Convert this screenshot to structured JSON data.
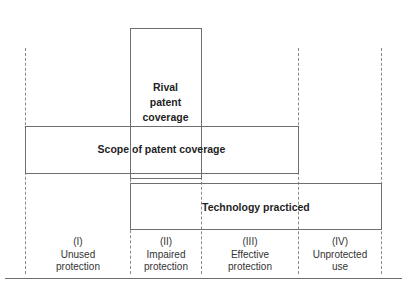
{
  "diagram": {
    "boxes": {
      "rival": {
        "label_line1": "Rival",
        "label_line2": "patent",
        "label_line3": "coverage"
      },
      "scope": {
        "label": "Scope of patent coverage"
      },
      "technology": {
        "label": "Technology practiced"
      }
    },
    "regions": [
      {
        "numeral": "(I)",
        "line1": "Unused",
        "line2": "protection"
      },
      {
        "numeral": "(II)",
        "line1": "Impaired",
        "line2": "protection"
      },
      {
        "numeral": "(III)",
        "line1": "Effective",
        "line2": "protection"
      },
      {
        "numeral": "(IV)",
        "line1": "Unprotected",
        "line2": "use"
      }
    ],
    "colors": {
      "line": "#6e6e6e",
      "dash": "#8a8a8a",
      "text": "#222222",
      "background": "#ffffff"
    }
  }
}
